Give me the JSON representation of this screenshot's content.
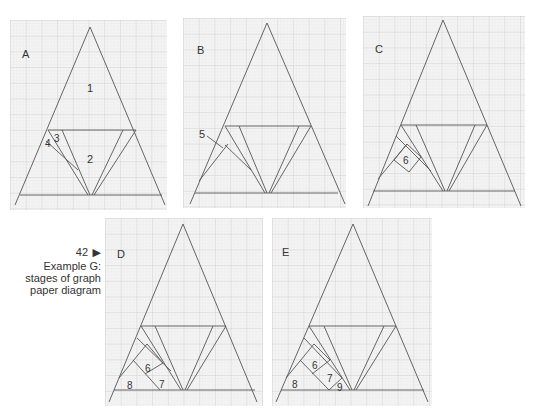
{
  "caption": {
    "figure_number": "42",
    "arrow": "▶",
    "lines": [
      "Example G:",
      "stages of graph",
      "paper diagram"
    ]
  },
  "colors": {
    "paper": "#f4f4f4",
    "grid_minor": "#dcdcdc",
    "grid_major": "#bdbdbd",
    "line": "#555555",
    "label": "#333333"
  },
  "panels": [
    {
      "id": "A",
      "label": "A",
      "numbers": [
        "1",
        "2",
        "3",
        "4"
      ]
    },
    {
      "id": "B",
      "label": "B",
      "numbers": [
        "5"
      ]
    },
    {
      "id": "C",
      "label": "C",
      "numbers": [
        "6"
      ]
    },
    {
      "id": "D",
      "label": "D",
      "numbers": [
        "6",
        "7",
        "8"
      ]
    },
    {
      "id": "E",
      "label": "E",
      "numbers": [
        "6",
        "7",
        "8",
        "9"
      ]
    }
  ]
}
